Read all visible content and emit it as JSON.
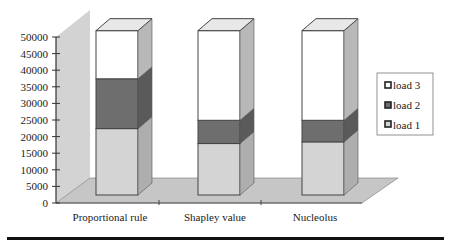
{
  "chart_data": {
    "type": "bar",
    "subtype": "3d-stacked-column",
    "title": "",
    "xlabel": "",
    "ylabel": "",
    "ylim": [
      0,
      50000
    ],
    "yticks": [
      0,
      5000,
      10000,
      15000,
      20000,
      25000,
      30000,
      35000,
      40000,
      45000,
      50000
    ],
    "categories": [
      "Proportional rule",
      "Shapley value",
      "Nucleolus"
    ],
    "series": [
      {
        "name": "load 1",
        "color": "#d4d4d4",
        "values": [
          20000,
          15500,
          16000
        ]
      },
      {
        "name": "load 2",
        "color": "#6e6e6e",
        "values": [
          15000,
          7000,
          6500
        ]
      },
      {
        "name": "load 3",
        "color": "#ffffff",
        "values": [
          14500,
          27000,
          27000
        ]
      }
    ],
    "legend": {
      "position": "right",
      "entries": [
        "load 3",
        "load 2",
        "load 1"
      ]
    },
    "grid": false
  },
  "axis": {
    "tick_labels": [
      "0",
      "5000",
      "10000",
      "15000",
      "20000",
      "25000",
      "30000",
      "35000",
      "40000",
      "45000",
      "50000"
    ]
  },
  "legend": {
    "items": [
      {
        "label": "load 3"
      },
      {
        "label": "load 2"
      },
      {
        "label": "load 1"
      }
    ]
  },
  "colors": {
    "wall": "#cfcfcf",
    "floor": "#c4c4c4",
    "outline": "#444444"
  }
}
